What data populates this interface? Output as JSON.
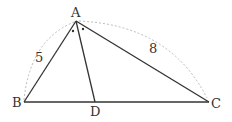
{
  "diagram": {
    "type": "geometry-triangle",
    "points": {
      "A": {
        "label": "A",
        "x": 76,
        "y": 21
      },
      "B": {
        "label": "B",
        "x": 24,
        "y": 102
      },
      "C": {
        "label": "C",
        "x": 209,
        "y": 102
      },
      "D": {
        "label": "D",
        "x": 95,
        "y": 102
      }
    },
    "side_labels": {
      "AB": "5",
      "AC": "8"
    },
    "angle_marks": "equal angles BAD and DAC (dots)",
    "colors": {
      "line": "#333333",
      "arc": "#bbbbbb"
    }
  }
}
